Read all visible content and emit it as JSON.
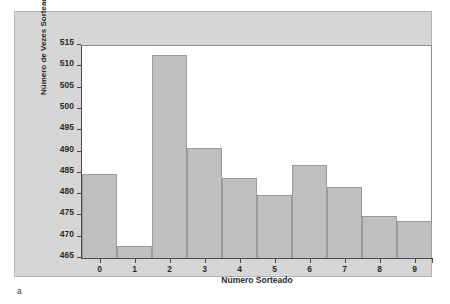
{
  "caption": "a",
  "chart_data": {
    "type": "bar",
    "title": "",
    "xlabel": "Número Sorteado",
    "ylabel": "Número de Vezes Sorteado",
    "categories": [
      "0",
      "1",
      "2",
      "3",
      "4",
      "5",
      "6",
      "7",
      "8",
      "9"
    ],
    "values": [
      485,
      468,
      513,
      491,
      484,
      480,
      487,
      482,
      475,
      474
    ],
    "ylim": [
      465,
      515
    ],
    "ytick_labels": [
      "465",
      "470",
      "475",
      "480",
      "485",
      "490",
      "495",
      "500",
      "505",
      "510",
      "515"
    ],
    "ytick_values": [
      465,
      470,
      475,
      480,
      485,
      490,
      495,
      500,
      505,
      510,
      515
    ],
    "grid": false,
    "legend": "none",
    "bar_color": "#bfbfbf",
    "bar_edge_color": "#9a9a9a",
    "plot_background": "#ffffff",
    "panel_background": "#d6d6d6"
  }
}
